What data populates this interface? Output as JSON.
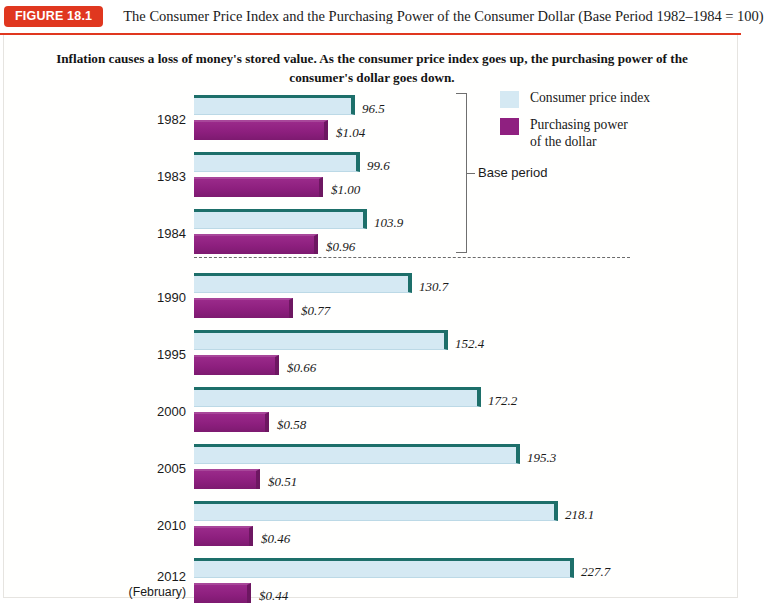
{
  "figure": {
    "badge": "FIGURE 18.1",
    "title": "The Consumer Price Index and the Purchasing Power of the Consumer Dollar (Base Period 1982–1984 = 100)",
    "subtitle": "Inflation causes a loss of money's stored value. As the consumer price index goes up, the purchasing power of the consumer's dollar goes down.",
    "badge_color": "#e0371f",
    "cpi_color": "#d5e9f3",
    "cpi_edge_color": "#1d6f6a",
    "ppd_color": "#8f2080"
  },
  "legend": {
    "position": "top-right",
    "items": [
      {
        "label": "Consumer price index",
        "color": "#d5e9f3"
      },
      {
        "label": "Purchasing power\nof the dollar",
        "color": "#8f2080"
      }
    ]
  },
  "annotation": {
    "base_period_label": "Base period"
  },
  "chart_data": {
    "type": "bar",
    "orientation": "horizontal",
    "title": "The Consumer Price Index and the Purchasing Power of the Consumer Dollar (Base Period 1982–1984 = 100)",
    "subtitle": "Inflation causes a loss of money's stored value. As the consumer price index goes up, the purchasing power of the consumer's dollar goes down.",
    "xlabel": "",
    "ylabel": "",
    "grid": false,
    "legend_position": "top-right",
    "categories": [
      "1982",
      "1983",
      "1984",
      "1990",
      "1995",
      "2000",
      "2005",
      "2010",
      "2012 (February)"
    ],
    "series": [
      {
        "name": "Consumer price index",
        "color": "#d5e9f3",
        "values": [
          96.5,
          99.6,
          103.9,
          130.7,
          152.4,
          172.2,
          195.3,
          218.1,
          227.7
        ],
        "labels": [
          "96.5",
          "99.6",
          "103.9",
          "130.7",
          "152.4",
          "172.2",
          "195.3",
          "218.1",
          "227.7"
        ]
      },
      {
        "name": "Purchasing power of the dollar",
        "color": "#8f2080",
        "values": [
          1.04,
          1.0,
          0.96,
          0.77,
          0.66,
          0.58,
          0.51,
          0.46,
          0.44
        ],
        "labels": [
          "$1.04",
          "$1.00",
          "$0.96",
          "$0.77",
          "$0.66",
          "$0.58",
          "$0.51",
          "$0.46",
          "$0.44"
        ]
      }
    ],
    "base_period_groups": [
      "1982",
      "1983",
      "1984"
    ],
    "annotations": [
      {
        "text": "Base period",
        "covers": [
          "1982",
          "1983",
          "1984"
        ]
      }
    ],
    "cpi_xlim": [
      0,
      227.7
    ],
    "ppd_xlim": [
      0,
      1.04
    ]
  },
  "rows": [
    {
      "year": "1982",
      "year_sub": "",
      "cpi": "96.5",
      "ppd": "$1.04",
      "cpi_px": 161,
      "ppd_px": 134
    },
    {
      "year": "1983",
      "year_sub": "",
      "cpi": "99.6",
      "ppd": "$1.00",
      "cpi_px": 166,
      "ppd_px": 129
    },
    {
      "year": "1984",
      "year_sub": "",
      "cpi": "103.9",
      "ppd": "$0.96",
      "cpi_px": 173,
      "ppd_px": 124
    },
    {
      "year": "1990",
      "year_sub": "",
      "cpi": "130.7",
      "ppd": "$0.77",
      "cpi_px": 218,
      "ppd_px": 99
    },
    {
      "year": "1995",
      "year_sub": "",
      "cpi": "152.4",
      "ppd": "$0.66",
      "cpi_px": 254,
      "ppd_px": 85
    },
    {
      "year": "2000",
      "year_sub": "",
      "cpi": "172.2",
      "ppd": "$0.58",
      "cpi_px": 287,
      "ppd_px": 75
    },
    {
      "year": "2005",
      "year_sub": "",
      "cpi": "195.3",
      "ppd": "$0.51",
      "cpi_px": 326,
      "ppd_px": 66
    },
    {
      "year": "2010",
      "year_sub": "",
      "cpi": "218.1",
      "ppd": "$0.46",
      "cpi_px": 364,
      "ppd_px": 59
    },
    {
      "year": "2012",
      "year_sub": "(February)",
      "cpi": "227.7",
      "ppd": "$0.44",
      "cpi_px": 380,
      "ppd_px": 57
    }
  ]
}
